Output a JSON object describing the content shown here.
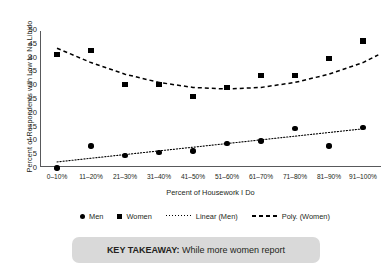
{
  "chart_data": {
    "type": "scatter",
    "title": "",
    "xlabel": "Percent of Housework I Do",
    "ylabel": "Percent of Respondents with Low to No Libido",
    "categories": [
      "0–10%",
      "11–20%",
      "21–30%",
      "31–40%",
      "41–50%",
      "51–60%",
      "61–70%",
      "71–80%",
      "81–90%",
      "91–100%"
    ],
    "ylim": [
      0,
      50
    ],
    "yticks": [
      0,
      5,
      10,
      15,
      20,
      25,
      30,
      35,
      40,
      45,
      50
    ],
    "grid": false,
    "legend_position": "bottom",
    "series": [
      {
        "name": "Men",
        "marker": "circle",
        "values": [
          0,
          8.0,
          4.6,
          5.6,
          6.1,
          8.9,
          9.8,
          14.3,
          8.0,
          14.6
        ]
      },
      {
        "name": "Women",
        "marker": "square",
        "values": [
          41.0,
          42.5,
          30.3,
          30.2,
          25.8,
          29.2,
          33.5,
          33.5,
          39.6,
          46.0
        ]
      }
    ],
    "trendlines": [
      {
        "name": "Linear (Men)",
        "style": "dotted",
        "for_series": "Men",
        "points": [
          [
            0,
            2.2
          ],
          [
            9,
            14.2
          ]
        ]
      },
      {
        "name": "Poly. (Women)",
        "style": "dashed",
        "for_series": "Women",
        "points": [
          [
            0,
            43.4
          ],
          [
            1,
            38.2
          ],
          [
            2,
            34.0
          ],
          [
            3,
            31.0
          ],
          [
            4,
            29.2
          ],
          [
            5,
            28.6
          ],
          [
            6,
            29.2
          ],
          [
            7,
            31.0
          ],
          [
            8,
            34.0
          ],
          [
            9,
            38.2
          ],
          [
            9.45,
            41.0
          ]
        ]
      }
    ]
  },
  "legend": {
    "items": [
      {
        "label": "Men",
        "icon": "filled-circle-marker"
      },
      {
        "label": "Women",
        "icon": "filled-square-marker"
      },
      {
        "label": "Linear (Men)",
        "icon": "dotted-line"
      },
      {
        "label": "Poly. (Women)",
        "icon": "dashed-line"
      }
    ]
  },
  "key_takeaway": {
    "prefix": "KEY TAKEAWAY:",
    "text": "While more women report"
  }
}
